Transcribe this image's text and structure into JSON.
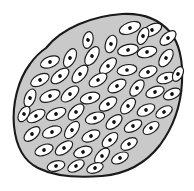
{
  "figure": {
    "background_color": "#ffffff",
    "width": 194,
    "height": 191
  },
  "tissue": {
    "name": "tissue-mass",
    "label": "",
    "fill_color": "#c9c9c9",
    "stroke_color": "#1a1a1a",
    "stroke_width": 2.1,
    "outline_path": "M 46,48 C 62,28 92,16 122,14 C 142,13 158,18 170,32 C 180,44 183,62 182,82 C 181,104 174,126 160,145 C 146,163 126,174 102,176 C 78,178 54,176 38,168 C 24,161 16,146 14,126 C 12,104 18,80 30,64 C 35,57 40,52 46,48 Z"
  },
  "cell_style": {
    "name": "epithelial-cell",
    "fill_color": "#ffffff",
    "stroke_color": "#1a1a1a",
    "stroke_width": 1.15,
    "nucleus_color": "#111111",
    "nucleus_radius": 1.85
  },
  "cells": [
    {
      "cx": 130,
      "cy": 28,
      "rx": 11.0,
      "ry": 5.6,
      "angle": -20
    },
    {
      "cx": 152,
      "cy": 30,
      "rx": 10.5,
      "ry": 5.4,
      "angle": -28
    },
    {
      "cx": 168,
      "cy": 38,
      "rx": 9.5,
      "ry": 5.2,
      "angle": -40
    },
    {
      "cx": 111,
      "cy": 44,
      "rx": 9.0,
      "ry": 5.5,
      "angle": -72
    },
    {
      "cx": 128,
      "cy": 50,
      "rx": 10.5,
      "ry": 5.5,
      "angle": -12
    },
    {
      "cx": 147,
      "cy": 52,
      "rx": 10.0,
      "ry": 5.4,
      "angle": -14
    },
    {
      "cx": 166,
      "cy": 58,
      "rx": 10.0,
      "ry": 5.4,
      "angle": -55
    },
    {
      "cx": 70,
      "cy": 58,
      "rx": 10.0,
      "ry": 5.4,
      "angle": -64
    },
    {
      "cx": 92,
      "cy": 56,
      "rx": 10.5,
      "ry": 5.5,
      "angle": -58
    },
    {
      "cx": 50,
      "cy": 62,
      "rx": 10.0,
      "ry": 5.3,
      "angle": -22
    },
    {
      "cx": 108,
      "cy": 66,
      "rx": 10.5,
      "ry": 5.4,
      "angle": -44
    },
    {
      "cx": 127,
      "cy": 70,
      "rx": 10.0,
      "ry": 5.3,
      "angle": -10
    },
    {
      "cx": 148,
      "cy": 72,
      "rx": 9.5,
      "ry": 5.3,
      "angle": -22
    },
    {
      "cx": 166,
      "cy": 78,
      "rx": 9.5,
      "ry": 5.2,
      "angle": -18
    },
    {
      "cx": 40,
      "cy": 80,
      "rx": 10.0,
      "ry": 5.3,
      "angle": -28
    },
    {
      "cx": 60,
      "cy": 76,
      "rx": 10.5,
      "ry": 5.4,
      "angle": -38
    },
    {
      "cx": 80,
      "cy": 74,
      "rx": 10.5,
      "ry": 5.5,
      "angle": -50
    },
    {
      "cx": 98,
      "cy": 80,
      "rx": 10.0,
      "ry": 5.4,
      "angle": -32
    },
    {
      "cx": 117,
      "cy": 86,
      "rx": 10.0,
      "ry": 5.4,
      "angle": -30
    },
    {
      "cx": 137,
      "cy": 88,
      "rx": 9.5,
      "ry": 5.3,
      "angle": -52
    },
    {
      "cx": 155,
      "cy": 92,
      "rx": 9.5,
      "ry": 5.2,
      "angle": -20
    },
    {
      "cx": 172,
      "cy": 94,
      "rx": 9.0,
      "ry": 5.0,
      "angle": -24
    },
    {
      "cx": 30,
      "cy": 98,
      "rx": 9.5,
      "ry": 5.2,
      "angle": -68
    },
    {
      "cx": 50,
      "cy": 96,
      "rx": 10.5,
      "ry": 5.4,
      "angle": -22
    },
    {
      "cx": 70,
      "cy": 94,
      "rx": 10.5,
      "ry": 5.5,
      "angle": -40
    },
    {
      "cx": 90,
      "cy": 98,
      "rx": 10.0,
      "ry": 5.4,
      "angle": -16
    },
    {
      "cx": 108,
      "cy": 104,
      "rx": 10.0,
      "ry": 5.4,
      "angle": -34
    },
    {
      "cx": 128,
      "cy": 106,
      "rx": 9.5,
      "ry": 5.3,
      "angle": -48
    },
    {
      "cx": 146,
      "cy": 110,
      "rx": 9.5,
      "ry": 5.2,
      "angle": -26
    },
    {
      "cx": 164,
      "cy": 112,
      "rx": 9.0,
      "ry": 5.0,
      "angle": -30
    },
    {
      "cx": 36,
      "cy": 116,
      "rx": 10.0,
      "ry": 5.3,
      "angle": -30
    },
    {
      "cx": 56,
      "cy": 114,
      "rx": 10.5,
      "ry": 5.4,
      "angle": -24
    },
    {
      "cx": 76,
      "cy": 112,
      "rx": 10.0,
      "ry": 5.4,
      "angle": -46
    },
    {
      "cx": 95,
      "cy": 118,
      "rx": 10.0,
      "ry": 5.4,
      "angle": -18
    },
    {
      "cx": 114,
      "cy": 122,
      "rx": 9.5,
      "ry": 5.3,
      "angle": -40
    },
    {
      "cx": 133,
      "cy": 126,
      "rx": 9.5,
      "ry": 5.2,
      "angle": -28
    },
    {
      "cx": 151,
      "cy": 128,
      "rx": 9.0,
      "ry": 5.0,
      "angle": -34
    },
    {
      "cx": 32,
      "cy": 134,
      "rx": 9.5,
      "ry": 5.2,
      "angle": -40
    },
    {
      "cx": 52,
      "cy": 132,
      "rx": 10.0,
      "ry": 5.4,
      "angle": -20
    },
    {
      "cx": 72,
      "cy": 130,
      "rx": 10.0,
      "ry": 5.4,
      "angle": -52
    },
    {
      "cx": 91,
      "cy": 136,
      "rx": 9.5,
      "ry": 5.3,
      "angle": -24
    },
    {
      "cx": 110,
      "cy": 140,
      "rx": 9.5,
      "ry": 5.3,
      "angle": -42
    },
    {
      "cx": 129,
      "cy": 144,
      "rx": 9.0,
      "ry": 5.1,
      "angle": -30
    },
    {
      "cx": 44,
      "cy": 150,
      "rx": 9.5,
      "ry": 5.2,
      "angle": -22
    },
    {
      "cx": 64,
      "cy": 148,
      "rx": 10.0,
      "ry": 5.3,
      "angle": -36
    },
    {
      "cx": 83,
      "cy": 152,
      "rx": 9.5,
      "ry": 5.3,
      "angle": -18
    },
    {
      "cx": 102,
      "cy": 156,
      "rx": 9.5,
      "ry": 5.2,
      "angle": -48
    },
    {
      "cx": 120,
      "cy": 158,
      "rx": 9.0,
      "ry": 5.0,
      "angle": -26
    },
    {
      "cx": 56,
      "cy": 166,
      "rx": 9.0,
      "ry": 5.0,
      "angle": -14
    },
    {
      "cx": 76,
      "cy": 166,
      "rx": 9.0,
      "ry": 5.0,
      "angle": -30
    },
    {
      "cx": 95,
      "cy": 168,
      "rx": 8.5,
      "ry": 4.8,
      "angle": -20
    },
    {
      "cx": 143,
      "cy": 36,
      "rx": 9.0,
      "ry": 5.0,
      "angle": -66
    },
    {
      "cx": 88,
      "cy": 40,
      "rx": 8.5,
      "ry": 5.0,
      "angle": -78
    },
    {
      "cx": 24,
      "cy": 114,
      "rx": 8.5,
      "ry": 4.8,
      "angle": -58
    },
    {
      "cx": 178,
      "cy": 74,
      "rx": 8.0,
      "ry": 4.6,
      "angle": -62
    }
  ]
}
